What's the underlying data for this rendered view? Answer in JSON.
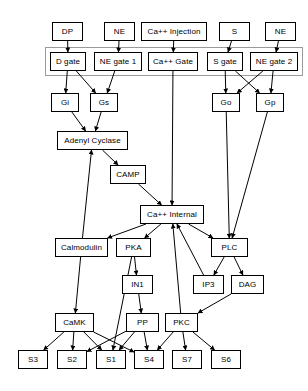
{
  "diagram": {
    "type": "flowchart",
    "background_color": "#ffffff",
    "node_fill": "#ffffff",
    "node_stroke": "#000000",
    "edge_color": "#000000",
    "group_stroke": "#9a9a9a",
    "nodes": [
      {
        "id": "dp",
        "label": "DP",
        "x": 52,
        "y": 22,
        "w": 31,
        "h": 19
      },
      {
        "id": "ne1",
        "label": "NE",
        "x": 104,
        "y": 22,
        "w": 31,
        "h": 19
      },
      {
        "id": "ca_inj",
        "label": "Ca++ Injection",
        "x": 141,
        "y": 22,
        "w": 66,
        "h": 19
      },
      {
        "id": "s",
        "label": "S",
        "x": 219,
        "y": 22,
        "w": 31,
        "h": 19
      },
      {
        "id": "ne2",
        "label": "NE",
        "x": 265,
        "y": 22,
        "w": 31,
        "h": 19
      },
      {
        "id": "d_gate",
        "label": "D gate",
        "x": 50,
        "y": 52,
        "w": 36,
        "h": 19
      },
      {
        "id": "ne_gate_1",
        "label": "NE gate 1",
        "x": 94,
        "y": 52,
        "w": 48,
        "h": 19
      },
      {
        "id": "ca_gate",
        "label": "Ca++ Gate",
        "x": 148,
        "y": 52,
        "w": 50,
        "h": 19
      },
      {
        "id": "s_gate",
        "label": "S gate",
        "x": 207,
        "y": 52,
        "w": 36,
        "h": 19
      },
      {
        "id": "ne_gate_2",
        "label": "NE gate 2",
        "x": 250,
        "y": 52,
        "w": 48,
        "h": 19
      },
      {
        "id": "gi",
        "label": "Gi",
        "x": 51,
        "y": 93,
        "w": 28,
        "h": 19
      },
      {
        "id": "gs",
        "label": "Gs",
        "x": 90,
        "y": 93,
        "w": 28,
        "h": 19
      },
      {
        "id": "go",
        "label": "Go",
        "x": 212,
        "y": 93,
        "w": 28,
        "h": 19
      },
      {
        "id": "gp",
        "label": "Gp",
        "x": 256,
        "y": 93,
        "w": 28,
        "h": 19
      },
      {
        "id": "adenyl",
        "label": "Adenyl Cyclase",
        "x": 57,
        "y": 131,
        "w": 71,
        "h": 19
      },
      {
        "id": "camp",
        "label": "CAMP",
        "x": 110,
        "y": 165,
        "w": 36,
        "h": 19
      },
      {
        "id": "ca_internal",
        "label": "Ca++ Internal",
        "x": 140,
        "y": 205,
        "w": 64,
        "h": 19
      },
      {
        "id": "calmodulin",
        "label": "Calmodulin",
        "x": 55,
        "y": 238,
        "w": 53,
        "h": 19
      },
      {
        "id": "pka",
        "label": "PKA",
        "x": 116,
        "y": 238,
        "w": 35,
        "h": 19
      },
      {
        "id": "plc",
        "label": "PLC",
        "x": 211,
        "y": 238,
        "w": 37,
        "h": 19
      },
      {
        "id": "in1",
        "label": "IN1",
        "x": 122,
        "y": 275,
        "w": 31,
        "h": 19
      },
      {
        "id": "ip3",
        "label": "IP3",
        "x": 193,
        "y": 275,
        "w": 31,
        "h": 19
      },
      {
        "id": "dag",
        "label": "DAG",
        "x": 231,
        "y": 275,
        "w": 33,
        "h": 19
      },
      {
        "id": "camk",
        "label": "CaMK",
        "x": 55,
        "y": 313,
        "w": 39,
        "h": 19
      },
      {
        "id": "pp",
        "label": "PP",
        "x": 126,
        "y": 313,
        "w": 33,
        "h": 19
      },
      {
        "id": "pkc",
        "label": "PKC",
        "x": 165,
        "y": 313,
        "w": 33,
        "h": 19
      },
      {
        "id": "s3",
        "label": "S3",
        "x": 18,
        "y": 350,
        "w": 30,
        "h": 19
      },
      {
        "id": "s2",
        "label": "S2",
        "x": 57,
        "y": 350,
        "w": 30,
        "h": 19
      },
      {
        "id": "s1",
        "label": "S1",
        "x": 96,
        "y": 350,
        "w": 30,
        "h": 19
      },
      {
        "id": "s4",
        "label": "S4",
        "x": 134,
        "y": 350,
        "w": 30,
        "h": 19
      },
      {
        "id": "s7",
        "label": "S7",
        "x": 172,
        "y": 350,
        "w": 30,
        "h": 19
      },
      {
        "id": "s6",
        "label": "S6",
        "x": 211,
        "y": 350,
        "w": 30,
        "h": 19
      }
    ],
    "group_container": {
      "id": "gate-membrane",
      "label": "",
      "x": 45,
      "y": 47,
      "w": 258,
      "h": 29
    },
    "edges": [
      {
        "from": "dp",
        "to": "d_gate"
      },
      {
        "from": "ne1",
        "to": "ne_gate_1"
      },
      {
        "from": "ca_inj",
        "to": "ca_gate"
      },
      {
        "from": "s",
        "to": "s_gate"
      },
      {
        "from": "ne2",
        "to": "ne_gate_2"
      },
      {
        "from": "d_gate",
        "to": "gi"
      },
      {
        "from": "d_gate",
        "to": "gs"
      },
      {
        "from": "ne_gate_1",
        "to": "gs"
      },
      {
        "from": "s_gate",
        "to": "go"
      },
      {
        "from": "s_gate",
        "to": "gp"
      },
      {
        "from": "ne_gate_2",
        "to": "go"
      },
      {
        "from": "ne_gate_2",
        "to": "gp"
      },
      {
        "from": "gi",
        "to": "adenyl"
      },
      {
        "from": "gs",
        "to": "adenyl"
      },
      {
        "from": "adenyl",
        "to": "camp"
      },
      {
        "from": "camp",
        "to": "ca_internal"
      },
      {
        "from": "ca_gate",
        "to": "ca_internal"
      },
      {
        "from": "go",
        "to": "plc"
      },
      {
        "from": "gp",
        "to": "plc"
      },
      {
        "from": "ca_internal",
        "to": "calmodulin"
      },
      {
        "from": "ca_internal",
        "to": "pka"
      },
      {
        "from": "ca_internal",
        "to": "plc"
      },
      {
        "from": "calmodulin",
        "to": "adenyl"
      },
      {
        "from": "calmodulin",
        "to": "camk"
      },
      {
        "from": "pka",
        "to": "in1"
      },
      {
        "from": "pka",
        "to": "s1"
      },
      {
        "from": "in1",
        "to": "pp"
      },
      {
        "from": "plc",
        "to": "ip3"
      },
      {
        "from": "plc",
        "to": "dag"
      },
      {
        "from": "ip3",
        "to": "ca_internal"
      },
      {
        "from": "dag",
        "to": "pkc"
      },
      {
        "from": "pkc",
        "to": "ca_internal"
      },
      {
        "from": "camk",
        "to": "s3"
      },
      {
        "from": "camk",
        "to": "s2"
      },
      {
        "from": "camk",
        "to": "s1"
      },
      {
        "from": "camk",
        "to": "s4"
      },
      {
        "from": "pp",
        "to": "s2"
      },
      {
        "from": "pp",
        "to": "s1"
      },
      {
        "from": "pp",
        "to": "s4"
      },
      {
        "from": "pkc",
        "to": "s4"
      },
      {
        "from": "pkc",
        "to": "s7"
      },
      {
        "from": "pkc",
        "to": "s6"
      }
    ]
  }
}
